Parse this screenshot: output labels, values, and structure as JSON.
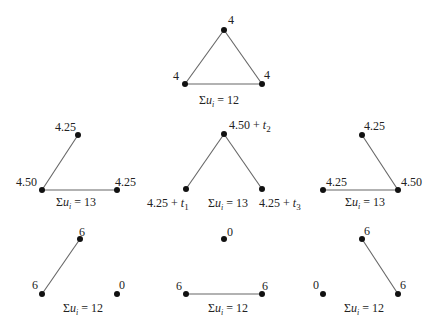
{
  "diagram": {
    "graphs": [
      {
        "id": "g0",
        "nodes": [
          {
            "x": 224,
            "y": 30,
            "label": "4",
            "lx": 228,
            "ly": 24,
            "sub": null
          },
          {
            "x": 185,
            "y": 84,
            "label": "4",
            "lx": 173,
            "ly": 80,
            "sub": null
          },
          {
            "x": 262,
            "y": 84,
            "label": "4",
            "lx": 264,
            "ly": 79,
            "sub": null
          }
        ],
        "edges": [
          [
            0,
            1
          ],
          [
            0,
            2
          ],
          [
            1,
            2
          ]
        ],
        "sum": {
          "text": "u",
          "subscript": "i",
          "eq": " = 12",
          "x": 199,
          "y": 104
        }
      },
      {
        "id": "g1",
        "nodes": [
          {
            "x": 78,
            "y": 135,
            "label": "4.25",
            "lx": 55,
            "ly": 131,
            "sub": null
          },
          {
            "x": 42,
            "y": 190,
            "label": "4.50",
            "lx": 16,
            "ly": 186,
            "sub": null
          },
          {
            "x": 117,
            "y": 190,
            "label": "4.25",
            "lx": 115,
            "ly": 186,
            "sub": null
          }
        ],
        "edges": [
          [
            0,
            1
          ],
          [
            1,
            2
          ]
        ],
        "sum": {
          "text": "u",
          "subscript": "i",
          "eq": " = 13",
          "x": 56,
          "y": 206
        }
      },
      {
        "id": "g2",
        "nodes": [
          {
            "x": 224,
            "y": 134,
            "label": "4.50 + t",
            "lx": 229,
            "ly": 129,
            "sub": "2"
          },
          {
            "x": 186,
            "y": 189,
            "label": "4.25 + t",
            "lx": 147,
            "ly": 207,
            "sub": "1"
          },
          {
            "x": 262,
            "y": 189,
            "label": "4.25 + t",
            "lx": 259,
            "ly": 207,
            "sub": "3"
          }
        ],
        "edges": [
          [
            0,
            1
          ],
          [
            0,
            2
          ]
        ],
        "sum": {
          "text": "u",
          "subscript": "i",
          "eq": " = 13",
          "x": 208,
          "y": 207
        }
      },
      {
        "id": "g3",
        "nodes": [
          {
            "x": 362,
            "y": 135,
            "label": "4.25",
            "lx": 364,
            "ly": 130,
            "sub": null
          },
          {
            "x": 323,
            "y": 190,
            "label": "4.25",
            "lx": 326,
            "ly": 186,
            "sub": null
          },
          {
            "x": 398,
            "y": 190,
            "label": "4.50",
            "lx": 401,
            "ly": 186,
            "sub": null
          }
        ],
        "edges": [
          [
            0,
            2
          ],
          [
            1,
            2
          ]
        ],
        "sum": {
          "text": "u",
          "subscript": "i",
          "eq": " = 13",
          "x": 345,
          "y": 206
        }
      },
      {
        "id": "g4",
        "nodes": [
          {
            "x": 80,
            "y": 239,
            "label": "6",
            "lx": 79,
            "ly": 236,
            "sub": null
          },
          {
            "x": 42,
            "y": 294,
            "label": "6",
            "lx": 32,
            "ly": 289,
            "sub": null
          },
          {
            "x": 117,
            "y": 294,
            "label": "0",
            "lx": 119,
            "ly": 289,
            "sub": null
          }
        ],
        "edges": [
          [
            0,
            1
          ]
        ],
        "sum": {
          "text": "u",
          "subscript": "i",
          "eq": " = 12",
          "x": 63,
          "y": 312
        }
      },
      {
        "id": "g5",
        "nodes": [
          {
            "x": 224,
            "y": 239,
            "label": "0",
            "lx": 227,
            "ly": 236,
            "sub": null
          },
          {
            "x": 186,
            "y": 294,
            "label": "6",
            "lx": 176,
            "ly": 290,
            "sub": null
          },
          {
            "x": 262,
            "y": 294,
            "label": "6",
            "lx": 262,
            "ly": 290,
            "sub": null
          }
        ],
        "edges": [
          [
            1,
            2
          ]
        ],
        "sum": {
          "text": "u",
          "subscript": "i",
          "eq": " = 12",
          "x": 208,
          "y": 312
        }
      },
      {
        "id": "g6",
        "nodes": [
          {
            "x": 362,
            "y": 239,
            "label": "6",
            "lx": 364,
            "ly": 235,
            "sub": null
          },
          {
            "x": 323,
            "y": 294,
            "label": "0",
            "lx": 313,
            "ly": 289,
            "sub": null
          },
          {
            "x": 398,
            "y": 294,
            "label": "6",
            "lx": 400,
            "ly": 289,
            "sub": null
          }
        ],
        "edges": [
          [
            0,
            2
          ]
        ],
        "sum": {
          "text": "u",
          "subscript": "i",
          "eq": " = 12",
          "x": 344,
          "y": 312
        }
      }
    ],
    "sigma": "Σ"
  }
}
